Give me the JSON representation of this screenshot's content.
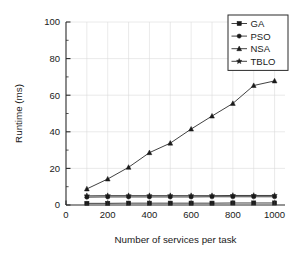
{
  "chart_data": {
    "type": "line",
    "title": "",
    "xlabel": "Number of services per task",
    "ylabel": "Runtime (ms)",
    "x": [
      100,
      200,
      300,
      400,
      500,
      600,
      700,
      800,
      900,
      1000
    ],
    "xlim": [
      0,
      1050
    ],
    "ylim": [
      0,
      100
    ],
    "xticks": [
      0,
      200,
      400,
      600,
      800,
      1000
    ],
    "yticks": [
      0,
      20,
      40,
      60,
      80,
      100
    ],
    "xtick_labels": [
      "0",
      "200",
      "400",
      "600",
      "800",
      "1000"
    ],
    "ytick_labels": [
      "0",
      "20",
      "40",
      "60",
      "80",
      "100"
    ],
    "x_minor_step": 100,
    "y_minor_step": 10,
    "grid": true,
    "legend_position": "top-right",
    "series": [
      {
        "name": "GA",
        "marker": "square",
        "values": [
          0.9,
          0.9,
          1.0,
          1.0,
          1.0,
          1.0,
          1.0,
          1.1,
          1.1,
          1.1
        ]
      },
      {
        "name": "PSO",
        "marker": "circle",
        "values": [
          4.3,
          4.4,
          4.4,
          4.4,
          4.4,
          4.4,
          4.5,
          4.5,
          4.5,
          4.5
        ]
      },
      {
        "name": "NSA",
        "marker": "triangle",
        "values": [
          8.8,
          14.2,
          20.6,
          28.6,
          33.8,
          41.5,
          48.6,
          55.5,
          65.3,
          67.8
        ]
      },
      {
        "name": "TBLO",
        "marker": "star",
        "values": [
          5.0,
          5.1,
          5.1,
          5.1,
          5.1,
          5.1,
          5.1,
          5.2,
          5.2,
          5.2
        ]
      }
    ],
    "colors": {
      "ink": "#1a1a1a",
      "axis": "#2b2b2b",
      "grid": "#d9d9d9",
      "background": "#ffffff"
    }
  }
}
